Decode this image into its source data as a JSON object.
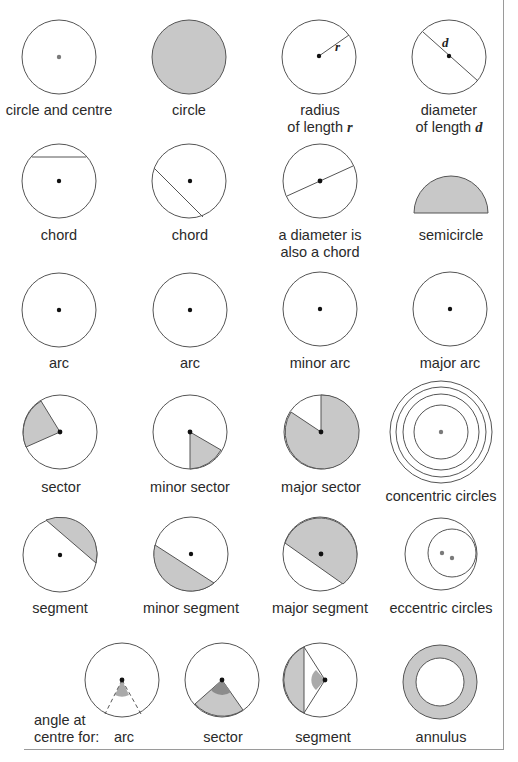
{
  "colors": {
    "stroke": "#555555",
    "fill_grey": "#c8c8c8",
    "fill_dark": "#8c8c8c",
    "fill_mid": "#aaaaaa",
    "dot": "#111111",
    "dot_grey": "#7a7a7a",
    "frame": "#9a9a9a"
  },
  "rows": [
    {
      "items": [
        {
          "name": "circle-and-centre",
          "label": "circle and centre"
        },
        {
          "name": "circle-filled",
          "label": "circle"
        },
        {
          "name": "radius",
          "label_line1": "radius",
          "label_line2": "of length",
          "var": "r",
          "symbol": "r"
        },
        {
          "name": "diameter",
          "label_line1": "diameter",
          "label_line2": "of length",
          "var": "d",
          "symbol": "d"
        }
      ]
    },
    {
      "items": [
        {
          "name": "chord-horizontal",
          "label": "chord"
        },
        {
          "name": "chord-diagonal",
          "label": "chord"
        },
        {
          "name": "diameter-chord",
          "label_line1": "a diameter is",
          "label_line2": "also a chord"
        },
        {
          "name": "semicircle",
          "label": "semicircle"
        }
      ]
    },
    {
      "items": [
        {
          "name": "arc-1",
          "label": "arc"
        },
        {
          "name": "arc-2",
          "label": "arc"
        },
        {
          "name": "minor-arc",
          "label": "minor arc"
        },
        {
          "name": "major-arc",
          "label": "major arc"
        }
      ]
    },
    {
      "items": [
        {
          "name": "sector",
          "label": "sector"
        },
        {
          "name": "minor-sector",
          "label": "minor sector"
        },
        {
          "name": "major-sector",
          "label": "major sector"
        },
        {
          "name": "concentric-circles",
          "label": "concentric circles"
        }
      ]
    },
    {
      "items": [
        {
          "name": "segment",
          "label": "segment"
        },
        {
          "name": "minor-segment",
          "label": "minor segment"
        },
        {
          "name": "major-segment",
          "label": "major segment"
        },
        {
          "name": "eccentric-circles",
          "label": "eccentric circles"
        }
      ]
    },
    {
      "intro_line1": "angle at",
      "intro_line2": "centre for:",
      "items": [
        {
          "name": "angle-arc",
          "label": "arc"
        },
        {
          "name": "angle-sector",
          "label": "sector"
        },
        {
          "name": "angle-segment",
          "label": "segment"
        },
        {
          "name": "annulus",
          "label": "annulus"
        }
      ]
    }
  ]
}
